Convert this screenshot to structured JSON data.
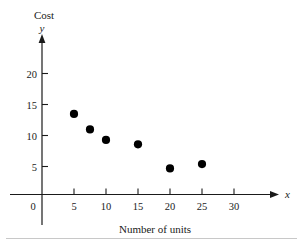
{
  "chart_data": {
    "type": "scatter",
    "title": "",
    "xlabel": "Number of units",
    "ylabel": "Cost",
    "x_axis_symbol": "x",
    "y_axis_symbol": "y",
    "xticks": [
      0,
      5,
      10,
      15,
      20,
      25,
      30
    ],
    "yticks": [
      5,
      10,
      15,
      20
    ],
    "xtick_labels": [
      "0",
      "5",
      "10",
      "15",
      "20",
      "25",
      "30"
    ],
    "ytick_labels": [
      "5",
      "10",
      "15",
      "20"
    ],
    "xlim": [
      0,
      36
    ],
    "ylim": [
      0,
      24.5
    ],
    "grid": false,
    "legend": null,
    "series": [
      {
        "name": "Cost vs units",
        "points": [
          {
            "x": 5,
            "y": 13
          },
          {
            "x": 7.5,
            "y": 10.5
          },
          {
            "x": 10,
            "y": 8.8
          },
          {
            "x": 15,
            "y": 8.1
          },
          {
            "x": 20,
            "y": 4.2
          },
          {
            "x": 25,
            "y": 4.9
          }
        ]
      }
    ]
  },
  "figure": {
    "origin_label": "0",
    "marker_color": "#000000",
    "axis_color": "#1a1a1a"
  }
}
